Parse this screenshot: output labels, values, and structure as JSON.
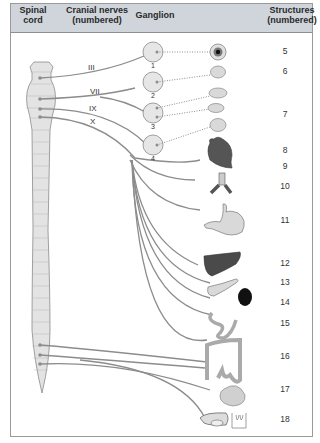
{
  "header": {
    "col_spinal": "Spinal cord",
    "col_spinal_l1": "Spinal",
    "col_spinal_l2": "cord",
    "col_cranial_l1": "Cranial nerves",
    "col_cranial_l2": "(numbered)",
    "col_ganglion": "Ganglion",
    "col_structures_l1": "Structures",
    "col_structures_l2": "(numbered)"
  },
  "cranial_nerves": [
    "III",
    "VII",
    "IX",
    "X"
  ],
  "ganglia": [
    "1",
    "2",
    "3",
    "4"
  ],
  "structures": [
    {
      "num": "5",
      "organ": "eye"
    },
    {
      "num": "6",
      "organ": "lacrimal-gland"
    },
    {
      "num": "7",
      "organ": "salivary-glands"
    },
    {
      "num": "8",
      "organ": "heart"
    },
    {
      "num": "9",
      "organ": "heart-lower"
    },
    {
      "num": "10",
      "organ": "bronchi"
    },
    {
      "num": "11",
      "organ": "stomach"
    },
    {
      "num": "12",
      "organ": "liver"
    },
    {
      "num": "13",
      "organ": "pancreas"
    },
    {
      "num": "14",
      "organ": "kidney"
    },
    {
      "num": "15",
      "organ": "small-intestine"
    },
    {
      "num": "16",
      "organ": "large-intestine"
    },
    {
      "num": "17",
      "organ": "bladder"
    },
    {
      "num": "18",
      "organ": "reproductive-organs"
    }
  ],
  "colors": {
    "header_bg": "#cfd5db",
    "nerve": "#8c8c8c",
    "spinal_fill": "#e3e3e3",
    "ganglion_fill": "#e6e6e6",
    "organ_light": "#d9d9d9",
    "organ_dark": "#4a4a4a"
  }
}
